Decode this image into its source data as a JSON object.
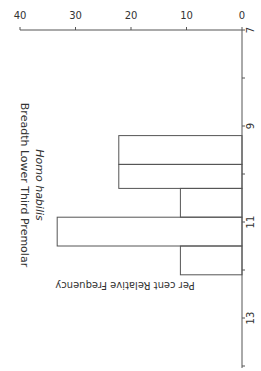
{
  "chart_data": {
    "type": "bar",
    "orientation": "rotated-90-clockwise histogram",
    "title": "Homo habilis",
    "subtitle": "Breadth Lower Third Premolar",
    "xlabel": "",
    "ylabel": "Per cent Relative Frequency",
    "x_ticks": [
      "7",
      "9",
      "11",
      "13"
    ],
    "x_range": [
      7,
      14
    ],
    "y_ticks": [
      "0",
      "10",
      "20",
      "30",
      "40"
    ],
    "ylim": [
      0,
      40
    ],
    "bins": [
      {
        "start": 9.2,
        "end": 9.8,
        "value": 22.2
      },
      {
        "start": 9.8,
        "end": 10.3,
        "value": 22.2
      },
      {
        "start": 10.3,
        "end": 10.9,
        "value": 11.1
      },
      {
        "start": 10.9,
        "end": 11.5,
        "value": 33.3
      },
      {
        "start": 11.5,
        "end": 12.1,
        "value": 11.1
      }
    ],
    "grid": false,
    "legend": null
  },
  "colors": {
    "line": "#555555",
    "text": "#333333",
    "background": "#ffffff"
  }
}
